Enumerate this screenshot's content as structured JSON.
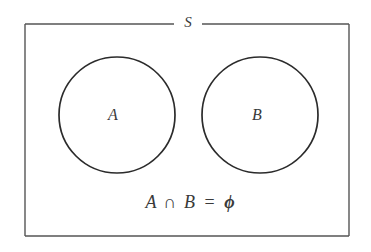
{
  "diagram": {
    "type": "venn",
    "title": "",
    "universe": {
      "label": "S",
      "name": "universal-set"
    },
    "sets": [
      {
        "label": "A",
        "name": "set-a"
      },
      {
        "label": "B",
        "name": "set-b"
      }
    ],
    "caption": {
      "full": "A ∩ B = ϕ",
      "left_operand": "A",
      "operator": "∩",
      "right_operand": "B",
      "equals": "=",
      "result": "ϕ"
    },
    "relationship": "disjoint",
    "colors": {
      "background": "#ffffff",
      "universe_stroke": "#555555",
      "circle_stroke": "#2b2b2b",
      "text": "#3a3a3a"
    }
  }
}
